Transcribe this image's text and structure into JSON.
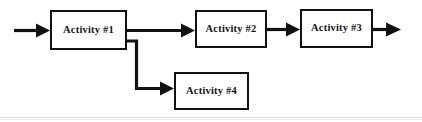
{
  "diagram": {
    "canvas": {
      "width": 422,
      "height": 122,
      "background": "#ffffff"
    },
    "stroke_color": "#111111",
    "nodes": [
      {
        "id": "activity-1",
        "label": "Activity #1",
        "x": 50,
        "y": 10,
        "w": 77,
        "h": 40
      },
      {
        "id": "activity-2",
        "label": "Activity #2",
        "x": 195,
        "y": 10,
        "w": 72,
        "h": 38
      },
      {
        "id": "activity-3",
        "label": "Activity #3",
        "x": 300,
        "y": 9,
        "w": 73,
        "h": 39
      },
      {
        "id": "activity-4",
        "label": "Activity #4",
        "x": 174,
        "y": 72,
        "w": 75,
        "h": 38
      }
    ],
    "connectors": [
      {
        "id": "entry-arrow",
        "from": "start",
        "to": "activity-1",
        "arrowhead": true
      },
      {
        "id": "a1-to-a2",
        "from": "activity-1",
        "to": "activity-2",
        "arrowhead": true
      },
      {
        "id": "a2-to-a3",
        "from": "activity-2",
        "to": "activity-3",
        "arrowhead": true
      },
      {
        "id": "a3-to-exit",
        "from": "activity-3",
        "to": "end",
        "arrowhead": true
      },
      {
        "id": "a1-to-a4",
        "from": "activity-1",
        "to": "activity-4",
        "arrowhead": true,
        "routing": "orthogonal"
      }
    ],
    "scan_artifact": {
      "visible": true,
      "color": "#d8d8d8"
    }
  }
}
